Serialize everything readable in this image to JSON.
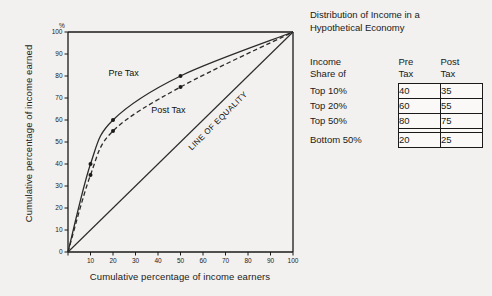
{
  "chart_data": {
    "type": "line",
    "title": "",
    "xlabel": "Cumulative percentage of income earners",
    "ylabel": "Cumulative percentage of income earned",
    "x_unit": "%",
    "y_unit": "%",
    "xlim": [
      0,
      100
    ],
    "ylim": [
      0,
      100
    ],
    "xticks": [
      0,
      10,
      20,
      30,
      40,
      50,
      60,
      70,
      80,
      90,
      100
    ],
    "yticks": [
      0,
      10,
      20,
      30,
      40,
      50,
      60,
      70,
      80,
      90,
      100
    ],
    "grid": false,
    "legend_position": "inline-annotations",
    "series": [
      {
        "name": "Pre Tax",
        "style": "solid",
        "markers": true,
        "x": [
          0,
          10,
          20,
          50,
          100
        ],
        "values": [
          0,
          40,
          60,
          80,
          100
        ]
      },
      {
        "name": "Post Tax",
        "style": "dashed",
        "markers": true,
        "x": [
          0,
          10,
          20,
          50,
          100
        ],
        "values": [
          0,
          35,
          55,
          75,
          100
        ]
      },
      {
        "name": "LINE OF EQUALITY",
        "style": "solid",
        "markers": false,
        "x": [
          0,
          100
        ],
        "values": [
          0,
          100
        ]
      }
    ],
    "annotations": [
      {
        "text": "Pre Tax",
        "x": 18,
        "y": 80
      },
      {
        "text": "Post Tax",
        "x": 37,
        "y": 63
      },
      {
        "text": "LINE OF EQUALITY",
        "x": 55,
        "y": 46,
        "rotation": -45
      }
    ]
  },
  "caption": {
    "line1": "Distribution of Income in a",
    "line2": "Hypothetical Economy"
  },
  "table": {
    "row_header_line1": "Income",
    "row_header_line2": "Share of",
    "columns": [
      {
        "line1": "Pre",
        "line2": "Tax"
      },
      {
        "line1": "Post",
        "line2": "Tax"
      }
    ],
    "rows": [
      {
        "label": "Top 10%",
        "pre_tax": "40",
        "post_tax": "35"
      },
      {
        "label": "Top 20%",
        "pre_tax": "60",
        "post_tax": "55"
      },
      {
        "label": "Top 50%",
        "pre_tax": "80",
        "post_tax": "75"
      },
      {
        "label": "Bottom 50%",
        "pre_tax": "20",
        "post_tax": "25"
      }
    ]
  },
  "colors": {
    "background": "#f2f1ef",
    "ink": "#1a1a1a",
    "cell_fill": "#faf9f7"
  }
}
